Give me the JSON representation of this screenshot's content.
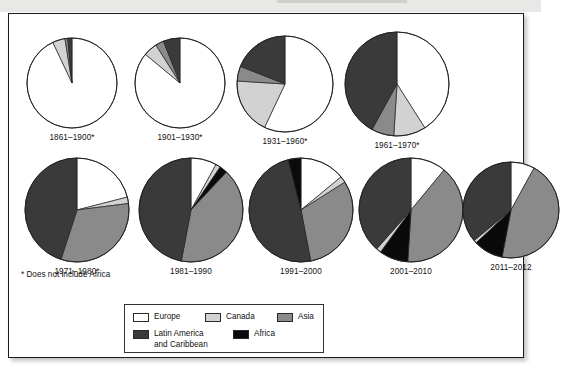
{
  "figure": {
    "footnote": "* Does not include Africa",
    "legend": {
      "entries": [
        {
          "label": "Europe",
          "color": "#ffffff"
        },
        {
          "label": "Canada",
          "color": "#d2d2d2"
        },
        {
          "label": "Asia",
          "color": "#8a8a8a"
        },
        {
          "label": "Latin America\nand Caribbean",
          "color": "#3a3a3a"
        },
        {
          "label": "Africa",
          "color": "#0a0a0a"
        }
      ]
    }
  },
  "chart_data": {
    "type": "pie",
    "title": "",
    "subtitle": "",
    "legend_position": "bottom",
    "annotations": [
      "* Does not include Africa"
    ],
    "categories": [
      "Europe",
      "Canada",
      "Asia",
      "Latin America and Caribbean",
      "Africa"
    ],
    "colors": [
      "#ffffff",
      "#d2d2d2",
      "#8a8a8a",
      "#3a3a3a",
      "#0a0a0a"
    ],
    "charts": [
      {
        "label": "1861–1900*",
        "slices": [
          {
            "name": "Europe",
            "value": 93.0
          },
          {
            "name": "Canada",
            "value": 4.5
          },
          {
            "name": "Asia",
            "value": 1.0
          },
          {
            "name": "Latin America and Caribbean",
            "value": 1.5
          },
          {
            "name": "Africa",
            "value": 0.0
          }
        ]
      },
      {
        "label": "1901–1930*",
        "slices": [
          {
            "name": "Europe",
            "value": 86.0
          },
          {
            "name": "Canada",
            "value": 5.0
          },
          {
            "name": "Asia",
            "value": 3.0
          },
          {
            "name": "Latin America and Caribbean",
            "value": 6.0
          },
          {
            "name": "Africa",
            "value": 0.0
          }
        ]
      },
      {
        "label": "1931–1960*",
        "slices": [
          {
            "name": "Europe",
            "value": 57.0
          },
          {
            "name": "Canada",
            "value": 19.0
          },
          {
            "name": "Asia",
            "value": 5.0
          },
          {
            "name": "Latin America and Caribbean",
            "value": 19.0
          },
          {
            "name": "Africa",
            "value": 0.0
          }
        ]
      },
      {
        "label": "1961–1970*",
        "slices": [
          {
            "name": "Europe",
            "value": 41.0
          },
          {
            "name": "Canada",
            "value": 10.0
          },
          {
            "name": "Asia",
            "value": 7.0
          },
          {
            "name": "Latin America and Caribbean",
            "value": 42.0
          },
          {
            "name": "Africa",
            "value": 0.0
          }
        ]
      },
      {
        "label": "1971–1980*",
        "slices": [
          {
            "name": "Europe",
            "value": 21.0
          },
          {
            "name": "Canada",
            "value": 2.0
          },
          {
            "name": "Asia",
            "value": 32.0
          },
          {
            "name": "Latin America and Caribbean",
            "value": 45.0
          },
          {
            "name": "Africa",
            "value": 0.0
          }
        ]
      },
      {
        "label": "1981–1990",
        "slices": [
          {
            "name": "Europe",
            "value": 8.0
          },
          {
            "name": "Canada",
            "value": 1.5
          },
          {
            "name": "Africa",
            "value": 2.5
          },
          {
            "name": "Asia",
            "value": 41.0
          },
          {
            "name": "Latin America and Caribbean",
            "value": 47.0
          }
        ]
      },
      {
        "label": "1991–2000",
        "slices": [
          {
            "name": "Europe",
            "value": 14.0
          },
          {
            "name": "Canada",
            "value": 2.0
          },
          {
            "name": "Asia",
            "value": 31.0
          },
          {
            "name": "Latin America and Caribbean",
            "value": 49.0
          },
          {
            "name": "Africa",
            "value": 4.0
          }
        ]
      },
      {
        "label": "2001–2010",
        "slices": [
          {
            "name": "Europe",
            "value": 11.0
          },
          {
            "name": "Asia",
            "value": 40.0
          },
          {
            "name": "Africa",
            "value": 9.0
          },
          {
            "name": "Canada",
            "value": 1.5
          },
          {
            "name": "Latin America and Caribbean",
            "value": 38.5
          }
        ]
      },
      {
        "label": "2011–2012",
        "slices": [
          {
            "name": "Europe",
            "value": 8.0
          },
          {
            "name": "Asia",
            "value": 45.0
          },
          {
            "name": "Africa",
            "value": 10.0
          },
          {
            "name": "Canada",
            "value": 1.0
          },
          {
            "name": "Latin America and Caribbean",
            "value": 36.0
          }
        ]
      }
    ]
  },
  "layout": {
    "positions": [
      {
        "left": 16,
        "top": 22,
        "radius": 45
      },
      {
        "left": 124,
        "top": 22,
        "radius": 45
      },
      {
        "left": 226,
        "top": 20,
        "radius": 48
      },
      {
        "left": 334,
        "top": 16,
        "radius": 52
      },
      {
        "left": 14,
        "top": 142,
        "radius": 52
      },
      {
        "left": 128,
        "top": 142,
        "radius": 52
      },
      {
        "left": 238,
        "top": 142,
        "radius": 52
      },
      {
        "left": 348,
        "top": 142,
        "radius": 52
      },
      {
        "left": 452,
        "top": 146,
        "radius": 48
      }
    ]
  }
}
